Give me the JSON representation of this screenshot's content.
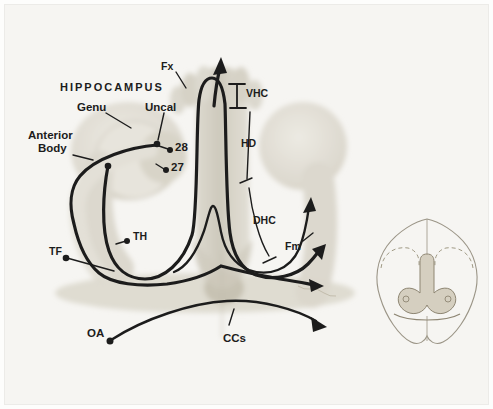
{
  "figure_title": "Hippocampus fornix system diagram",
  "colors": {
    "background": "#f6f5f2",
    "ink": "#1c1c1c",
    "wash_light": "#e3e0d7",
    "wash_mid": "#d7d3c7",
    "wash_dark": "#c6c1b2",
    "inset_stroke": "#9b9587"
  },
  "labels": {
    "hippocampus": "HIPPOCAMPUS",
    "genu": "Genu",
    "uncal": "Uncal",
    "anterior": "Anterior",
    "body": "Body",
    "fx": "Fx",
    "vhc": "VHC",
    "hd": "HD",
    "dhc": "DHC",
    "fm": "Fm",
    "th": "TH",
    "tf": "TF",
    "oa": "OA",
    "ccs": "CCs",
    "area28": "28",
    "area27": "27"
  }
}
